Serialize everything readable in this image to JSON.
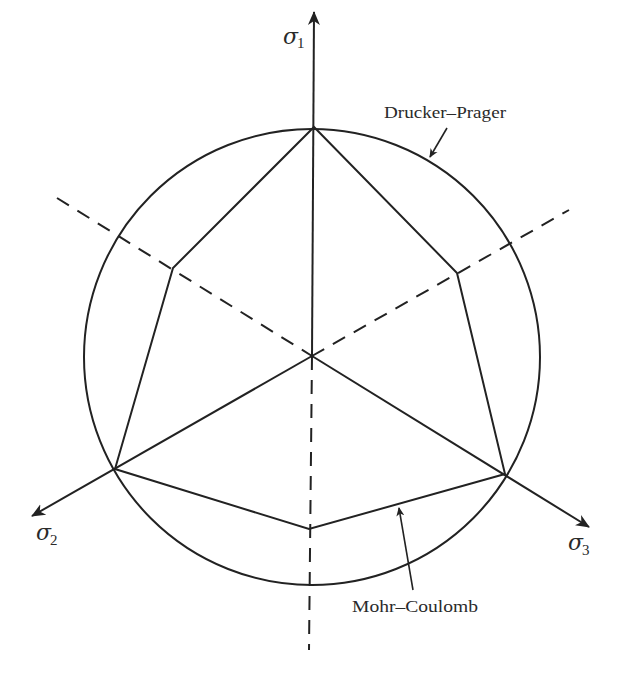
{
  "diagram": {
    "stroke_color": "#222222",
    "background": "#ffffff",
    "center": [
      312,
      356
    ],
    "axes": [
      {
        "id": "sigma1",
        "symbol": "σ",
        "subscript": "1",
        "label_pos": [
          283,
          44
        ],
        "tip": [
          314,
          10
        ]
      },
      {
        "id": "sigma2",
        "symbol": "σ",
        "subscript": "2",
        "label_pos": [
          36,
          540
        ],
        "tip": [
          30,
          517
        ]
      },
      {
        "id": "sigma3",
        "symbol": "σ",
        "subscript": "3",
        "label_pos": [
          568,
          550
        ],
        "tip": [
          591,
          528
        ]
      }
    ],
    "dashed_axes": [
      {
        "from": [
          57,
          198
        ],
        "to": [
          312,
          356
        ]
      },
      {
        "from": [
          312,
          356
        ],
        "to": [
          569,
          210
        ]
      },
      {
        "from": [
          312,
          356
        ],
        "to": [
          309,
          650
        ]
      }
    ],
    "drucker_prager": {
      "label": "Drucker–Prager",
      "label_pos": [
        384,
        118
      ],
      "circle": {
        "cx": 312,
        "cy": 357,
        "r": 228
      },
      "arrow": {
        "from": [
          447,
          128
        ],
        "to": [
          429,
          158
        ]
      }
    },
    "mohr_coulomb": {
      "label": "Mohr–Coulomb",
      "label_pos": [
        352,
        612
      ],
      "hexagon": [
        [
          314,
          127
        ],
        [
          457,
          273
        ],
        [
          505,
          474
        ],
        [
          309,
          529
        ],
        [
          115,
          469
        ],
        [
          173,
          268
        ]
      ],
      "arrow": {
        "from": [
          413,
          590
        ],
        "to": [
          398,
          506
        ]
      }
    }
  }
}
